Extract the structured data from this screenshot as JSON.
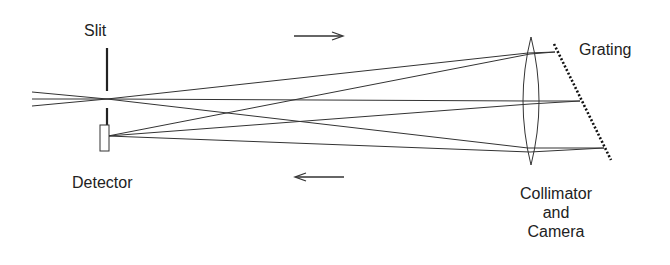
{
  "diagram": {
    "type": "optical-layout",
    "labels": {
      "slit": "Slit",
      "detector": "Detector",
      "grating": "Grating",
      "lens_line1": "Collimator",
      "lens_line2": "and",
      "lens_line3": "Camera"
    },
    "arrows": [
      {
        "name": "outgoing-direction",
        "direction": "right"
      },
      {
        "name": "return-direction",
        "direction": "left"
      }
    ],
    "components": [
      "slit",
      "detector",
      "collimator-camera-lens",
      "grating"
    ],
    "colors": {
      "line": "#333333",
      "text": "#222222",
      "background": "#ffffff"
    }
  }
}
